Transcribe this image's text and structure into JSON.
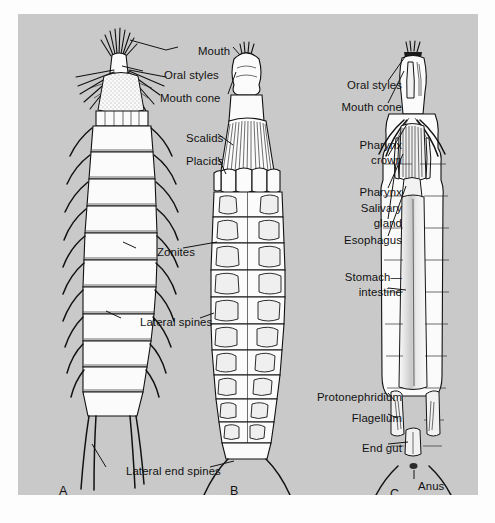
{
  "figure": {
    "panels": [
      {
        "letter": "A",
        "name": "lateral-external-view"
      },
      {
        "letter": "B",
        "name": "ventral-external-view"
      },
      {
        "letter": "C",
        "name": "internal-anatomy-view"
      }
    ]
  },
  "labels_left": [
    {
      "text": "Mouth",
      "x": 180,
      "y": 37,
      "align": "left"
    },
    {
      "text": "Oral styles",
      "x": 146,
      "y": 61,
      "align": "left"
    },
    {
      "text": "Mouth cone",
      "x": 142,
      "y": 84,
      "align": "left"
    },
    {
      "text": "Scalids",
      "x": 168,
      "y": 124,
      "align": "left"
    },
    {
      "text": "Placids",
      "x": 168,
      "y": 147,
      "align": "left"
    },
    {
      "text": "Zonites",
      "x": 139,
      "y": 238,
      "align": "left"
    },
    {
      "text": "Lateral spines",
      "x": 122,
      "y": 308,
      "align": "left"
    },
    {
      "text": "Lateral end spines",
      "x": 108,
      "y": 457,
      "align": "left"
    }
  ],
  "labels_right": [
    {
      "text": "Oral styles",
      "x": 384,
      "y": 71,
      "align": "right"
    },
    {
      "text": "Mouth cone",
      "x": 384,
      "y": 93,
      "align": "right"
    },
    {
      "text": "Pharynx",
      "x": 384,
      "y": 131,
      "align": "right"
    },
    {
      "text": "crown",
      "x": 384,
      "y": 146,
      "align": "right"
    },
    {
      "text": "Pharynx",
      "x": 384,
      "y": 178,
      "align": "right"
    },
    {
      "text": "Salivary",
      "x": 384,
      "y": 194,
      "align": "right"
    },
    {
      "text": "gland",
      "x": 384,
      "y": 209,
      "align": "right"
    },
    {
      "text": "Esophagus",
      "x": 384,
      "y": 226,
      "align": "right"
    },
    {
      "text": "Stomach—",
      "x": 384,
      "y": 263,
      "align": "right"
    },
    {
      "text": "intestine",
      "x": 384,
      "y": 278,
      "align": "right"
    },
    {
      "text": "Protonephridium",
      "x": 384,
      "y": 383,
      "align": "right"
    },
    {
      "text": "Flagellum",
      "x": 384,
      "y": 404,
      "align": "right"
    },
    {
      "text": "End gut",
      "x": 384,
      "y": 434,
      "align": "right"
    },
    {
      "text": "Anus",
      "x": 400,
      "y": 472,
      "align": "left"
    }
  ],
  "panel_letters": [
    {
      "text": "A",
      "x": 41,
      "y": 478
    },
    {
      "text": "B",
      "x": 212,
      "y": 478
    },
    {
      "text": "C",
      "x": 372,
      "y": 481
    }
  ],
  "colors": {
    "plate_background": "#c9c9c9",
    "page_background": "#fdfdfd",
    "line": "#111111",
    "organism_fill": "#fbfbfb",
    "organ_fill": "#f2f2f2"
  }
}
